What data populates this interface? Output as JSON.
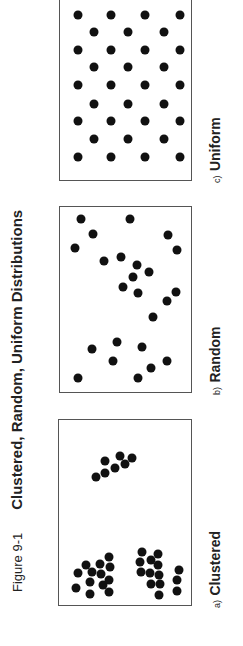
{
  "figure": {
    "label": "Figure 9-1",
    "title": "Clustered, Random, Uniform Distributions",
    "orientation": "rotated -90deg"
  },
  "colors": {
    "dot": "#111111",
    "frame": "#555555",
    "text": "#222222",
    "background": "#ffffff"
  },
  "panels": [
    {
      "id": "a",
      "prefix": "a)",
      "name": "Clustered",
      "box": {
        "left": 58,
        "top": 419,
        "width": 134,
        "height": 187
      },
      "caption_pos": {
        "x": 206,
        "y": 608
      },
      "dots": [
        [
          37,
          57
        ],
        [
          46,
          53
        ],
        [
          46,
          41
        ],
        [
          56,
          48
        ],
        [
          61,
          36
        ],
        [
          66,
          44
        ],
        [
          73,
          38
        ],
        [
          17,
          168
        ],
        [
          19,
          153
        ],
        [
          27,
          145
        ],
        [
          33,
          152
        ],
        [
          31,
          162
        ],
        [
          31,
          174
        ],
        [
          41,
          144
        ],
        [
          42,
          154
        ],
        [
          44,
          165
        ],
        [
          50,
          137
        ],
        [
          51,
          147
        ],
        [
          50,
          160
        ],
        [
          50,
          172
        ],
        [
          83,
          132
        ],
        [
          81,
          142
        ],
        [
          82,
          152
        ],
        [
          92,
          140
        ],
        [
          91,
          153
        ],
        [
          99,
          134
        ],
        [
          99,
          145
        ],
        [
          100,
          155
        ],
        [
          101,
          164
        ],
        [
          92,
          164
        ],
        [
          100,
          175
        ],
        [
          120,
          150
        ],
        [
          118,
          160
        ],
        [
          118,
          171
        ]
      ]
    },
    {
      "id": "b",
      "prefix": "b)",
      "name": "Random",
      "box": {
        "left": 59,
        "top": 206,
        "width": 133,
        "height": 187
      },
      "caption_pos": {
        "x": 206,
        "y": 395
      },
      "dots": [
        [
          21,
          12
        ],
        [
          70,
          12
        ],
        [
          33,
          27
        ],
        [
          108,
          28
        ],
        [
          15,
          41
        ],
        [
          117,
          43
        ],
        [
          44,
          54
        ],
        [
          61,
          50
        ],
        [
          77,
          58
        ],
        [
          89,
          65
        ],
        [
          73,
          70
        ],
        [
          63,
          80
        ],
        [
          78,
          86
        ],
        [
          116,
          85
        ],
        [
          107,
          94
        ],
        [
          93,
          110
        ],
        [
          57,
          135
        ],
        [
          32,
          142
        ],
        [
          82,
          140
        ],
        [
          53,
          154
        ],
        [
          107,
          154
        ],
        [
          91,
          161
        ],
        [
          18,
          171
        ],
        [
          78,
          171
        ]
      ]
    },
    {
      "id": "c",
      "prefix": "c)",
      "name": "Uniform",
      "box": {
        "left": 59,
        "top": -6,
        "width": 133,
        "height": 187
      },
      "caption_pos": {
        "x": 206,
        "y": 183
      },
      "dots": [
        [
          18,
          20
        ],
        [
          51,
          20
        ],
        [
          85,
          20
        ],
        [
          120,
          20
        ],
        [
          34,
          37
        ],
        [
          68,
          37
        ],
        [
          104,
          37
        ],
        [
          18,
          55
        ],
        [
          51,
          55
        ],
        [
          85,
          55
        ],
        [
          120,
          55
        ],
        [
          34,
          72
        ],
        [
          68,
          72
        ],
        [
          104,
          72
        ],
        [
          18,
          90
        ],
        [
          51,
          90
        ],
        [
          85,
          90
        ],
        [
          120,
          90
        ],
        [
          34,
          109
        ],
        [
          68,
          109
        ],
        [
          104,
          109
        ],
        [
          18,
          126
        ],
        [
          51,
          126
        ],
        [
          85,
          126
        ],
        [
          120,
          126
        ],
        [
          34,
          144
        ],
        [
          68,
          144
        ],
        [
          104,
          144
        ],
        [
          18,
          162
        ],
        [
          51,
          162
        ],
        [
          85,
          162
        ],
        [
          120,
          162
        ]
      ]
    }
  ]
}
